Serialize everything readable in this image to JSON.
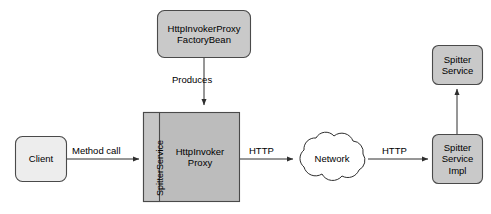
{
  "diagram": {
    "canvas": {
      "width": 491,
      "height": 214,
      "background": "#ffffff"
    },
    "colors": {
      "stroke": "#3a3a3a",
      "client_fill": "#ededed",
      "node_fill": "#c8c8c8",
      "proxy_fill": "#bcbcbc",
      "strip_fill": "#c4c4c4",
      "cloud_fill": "#ffffff",
      "text": "#000000"
    },
    "nodes": [
      {
        "id": "client",
        "label": "Client",
        "shape": "rounded-rect",
        "fill": "#ededed",
        "x": 15,
        "y": 136,
        "w": 52,
        "h": 46
      },
      {
        "id": "factory-bean",
        "label": "HttpInvokerProxy\nFactoryBean",
        "shape": "rounded-rect",
        "fill": "#c8c8c8",
        "x": 157,
        "y": 10,
        "w": 94,
        "h": 48
      },
      {
        "id": "http-invoker-proxy",
        "label": "HttpInvoker\nProxy",
        "shape": "rect",
        "fill": "#bcbcbc",
        "x": 143,
        "y": 112,
        "w": 97,
        "h": 90
      },
      {
        "id": "spitter-service-strip",
        "label": "SpitterService",
        "shape": "vertical-strip",
        "fill": "#c4c4c4",
        "x": 143,
        "y": 112,
        "w": 16,
        "h": 90
      },
      {
        "id": "network",
        "label": "Network",
        "shape": "cloud",
        "fill": "#ffffff",
        "x": 296,
        "y": 133,
        "w": 72,
        "h": 56
      },
      {
        "id": "spitter-service-impl",
        "label": "Spitter\nService\nImpl",
        "shape": "rounded-rect",
        "fill": "#c8c8c8",
        "x": 432,
        "y": 134,
        "w": 51,
        "h": 50
      },
      {
        "id": "spitter-service",
        "label": "Spitter\nService",
        "shape": "rounded-rect",
        "fill": "#c8c8c8",
        "x": 432,
        "y": 45,
        "w": 51,
        "h": 40
      }
    ],
    "edges": [
      {
        "id": "produces",
        "label": "Produces",
        "from": "factory-bean",
        "to": "http-invoker-proxy",
        "direction": "down"
      },
      {
        "id": "method-call",
        "label": "Method call",
        "from": "client",
        "to": "http-invoker-proxy",
        "direction": "right"
      },
      {
        "id": "http-out",
        "label": "HTTP",
        "from": "http-invoker-proxy",
        "to": "network",
        "direction": "right"
      },
      {
        "id": "http-in",
        "label": "HTTP",
        "from": "network",
        "to": "spitter-service-impl",
        "direction": "right"
      },
      {
        "id": "implements",
        "label": "",
        "from": "spitter-service-impl",
        "to": "spitter-service",
        "direction": "up"
      }
    ]
  }
}
